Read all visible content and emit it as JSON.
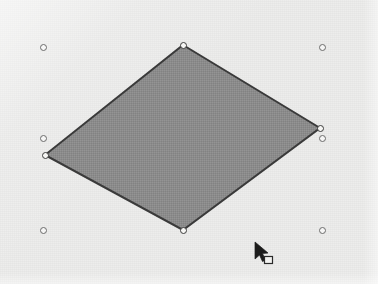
{
  "app": {
    "view": "vector-drawing-canvas",
    "width": 378,
    "height": 284,
    "background_color": "#ececeb"
  },
  "canvas": {
    "label": "Drawing canvas",
    "background_color": "#ececeb"
  },
  "shape": {
    "name": "rhombus",
    "label": "Selected rhombus shape",
    "type": "polygon",
    "fill_color": "#8b8b8b",
    "stroke_color": "#3a3a3a",
    "stroke_width": 2,
    "selected": true,
    "points": [
      {
        "name": "top-vertex",
        "x": 183,
        "y": 45
      },
      {
        "name": "right-vertex",
        "x": 320,
        "y": 128
      },
      {
        "name": "bottom-vertex",
        "x": 183,
        "y": 230
      },
      {
        "name": "left-vertex",
        "x": 45,
        "y": 155
      }
    ],
    "points_attr": "183,45 320,128 183,230 45,155"
  },
  "vertex_handles": {
    "label": "Path node handles",
    "fill_color": "#f6f6f4",
    "stroke_color": "#3c3c3c",
    "items": [
      {
        "name": "vertex-handle-top",
        "x": 183,
        "y": 45
      },
      {
        "name": "vertex-handle-right",
        "x": 320,
        "y": 128
      },
      {
        "name": "vertex-handle-bottom",
        "x": 183,
        "y": 230
      },
      {
        "name": "vertex-handle-left",
        "x": 45,
        "y": 155
      }
    ]
  },
  "selection_handles": {
    "label": "Selection bounding handles",
    "stroke_color": "#6b6b6b",
    "items": [
      {
        "name": "handle-top-left",
        "x": 43,
        "y": 47
      },
      {
        "name": "handle-top-right",
        "x": 322,
        "y": 47
      },
      {
        "name": "handle-middle-left",
        "x": 43,
        "y": 138
      },
      {
        "name": "handle-middle-right",
        "x": 322,
        "y": 138
      },
      {
        "name": "handle-bottom-left",
        "x": 43,
        "y": 230
      },
      {
        "name": "handle-bottom-right",
        "x": 322,
        "y": 230
      }
    ]
  },
  "cursor": {
    "label": "Move / drag object pointer",
    "type": "arrow-with-square",
    "x": 255,
    "y": 243,
    "color": "#1c1c1c"
  }
}
